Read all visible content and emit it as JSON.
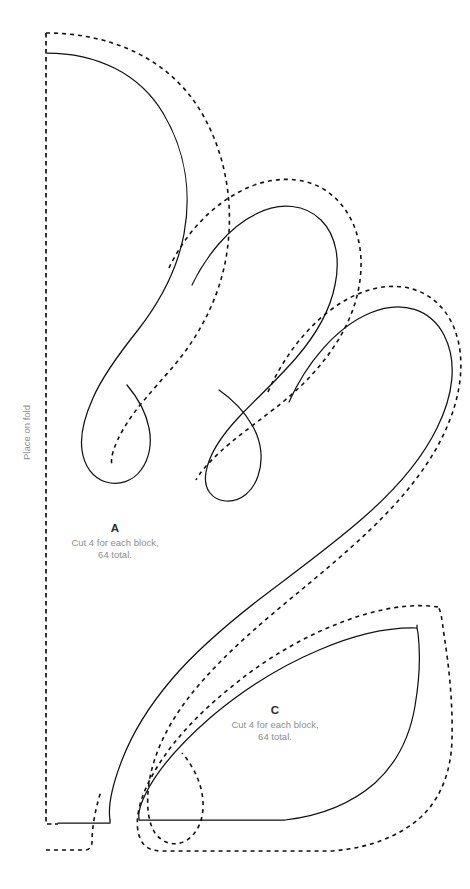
{
  "document": {
    "type": "applique-pattern-template",
    "background_color": "#ffffff"
  },
  "fold": {
    "label": "Place on fold",
    "line_style": "dashed",
    "color": "#111111",
    "orientation": "vertical-left-edge"
  },
  "colors": {
    "cut_line": "#111111",
    "seam_line": "#111111",
    "fold_line": "#111111",
    "letter_text": "#2b2b2b",
    "note_text": "#8e8e8e",
    "background": "#ffffff"
  },
  "pieces": [
    {
      "letter": "A",
      "note_line_1": "Cut 4 for each block,",
      "note_line_2": "64 total."
    },
    {
      "letter": "C",
      "note_line_1": "Cut 4 for each block,",
      "note_line_2": "64 total."
    }
  ],
  "legend": {
    "solid_meaning": "finished cut line",
    "dashed_meaning": "seam allowance"
  }
}
